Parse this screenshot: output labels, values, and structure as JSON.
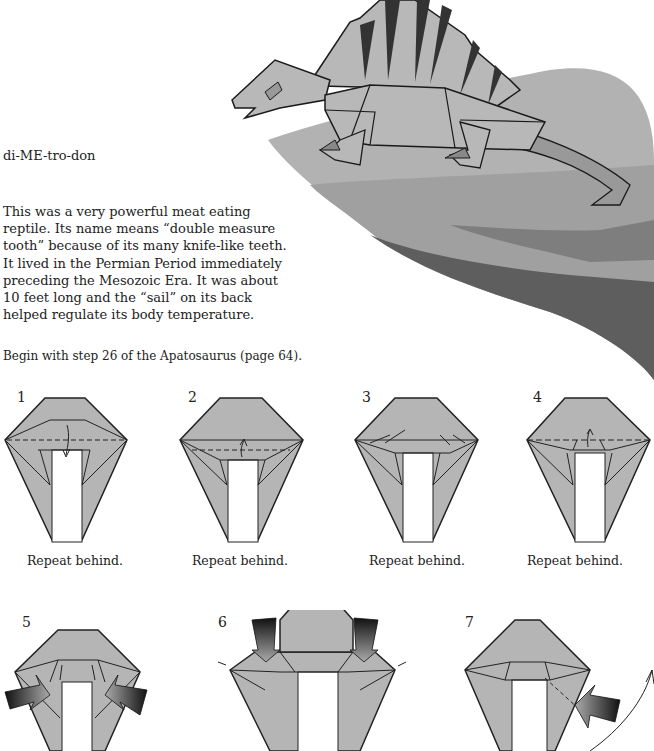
{
  "header": {
    "pronunciation": "di-ME-tro-don",
    "description_lines": [
      "This was a very powerful meat eating",
      "reptile. Its name means “double measure",
      "tooth” because of its many knife-like teeth.",
      "It lived in the Permian Period immediately",
      "preceding the Mesozoic Era. It was about",
      "10 feet long and the “sail” on its back",
      "helped regulate its body temperature."
    ]
  },
  "hero": {
    "icon": "origami-dimetrodon-on-rock",
    "colors": {
      "paper": "#b8b8b8",
      "rock_top": "#b0b0b0",
      "rock_mid": "#9a9a9a",
      "rock_dark": "#6e6e6e",
      "rock_darker": "#555555",
      "outline": "#1a1a1a"
    }
  },
  "intro": "Begin with step 26 of the Apatosaurus (page 64).",
  "steps": [
    {
      "number": "1",
      "caption": "Repeat behind."
    },
    {
      "number": "2",
      "caption": "Repeat behind."
    },
    {
      "number": "3",
      "caption": "Repeat behind."
    },
    {
      "number": "4",
      "caption": "Repeat behind."
    },
    {
      "number": "5",
      "caption": ""
    },
    {
      "number": "6",
      "caption": ""
    },
    {
      "number": "7",
      "caption": ""
    }
  ],
  "diagram_colors": {
    "paper": "#b5b5b5",
    "line": "#222222",
    "arrow_dark": "#111111",
    "arrow_light": "#9a9a9a"
  }
}
